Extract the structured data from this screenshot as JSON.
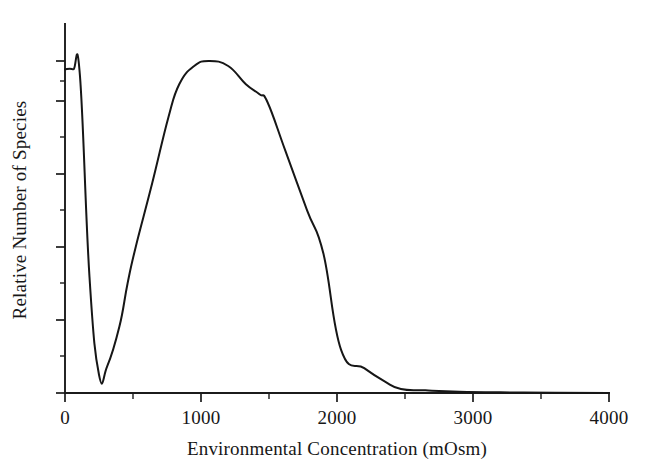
{
  "chart_data": {
    "type": "line",
    "title": "",
    "xlabel": "Environmental Concentration (mOsm)",
    "ylabel": "Relative Number of Species",
    "xlim": [
      0,
      4000
    ],
    "ylim": [
      0,
      1.05
    ],
    "grid": false,
    "legend": null,
    "x_ticks_major": [
      0,
      1000,
      2000,
      3000,
      4000
    ],
    "x_tick_labels": [
      "0",
      "1000",
      "2000",
      "3000",
      "4000"
    ],
    "x_ticks_minor": [
      500,
      1500,
      2500,
      3500
    ],
    "y_ticks_major": [
      0.0,
      0.2,
      0.4,
      0.6,
      0.8,
      1.0
    ],
    "y_tick_labels": [
      "0",
      "",
      "",
      "",
      "",
      ""
    ],
    "y_ticks_minor": [
      0.1,
      0.3,
      0.5,
      0.7,
      0.9
    ],
    "y_origin_label": "0",
    "series": [
      {
        "name": "Relative number of species",
        "x": [
          0,
          60,
          110,
          180,
          250,
          310,
          400,
          460,
          520,
          640,
          760,
          840,
          950,
          1060,
          1200,
          1330,
          1430,
          1490,
          1620,
          1780,
          1900,
          2030,
          2200,
          2350,
          2470,
          2650,
          2900,
          3200,
          3600,
          4000
        ],
        "y": [
          0.975,
          0.975,
          0.955,
          0.35,
          0.055,
          0.08,
          0.2,
          0.33,
          0.44,
          0.63,
          0.83,
          0.93,
          0.985,
          1.0,
          0.985,
          0.93,
          0.9,
          0.875,
          0.73,
          0.55,
          0.42,
          0.13,
          0.075,
          0.035,
          0.012,
          0.008,
          0.004,
          0.002,
          0.001,
          0.0
        ]
      }
    ],
    "colors": {
      "curve": "#161616",
      "axis": "#1b1b1b",
      "background": "#ffffff",
      "text": "#171717"
    }
  }
}
